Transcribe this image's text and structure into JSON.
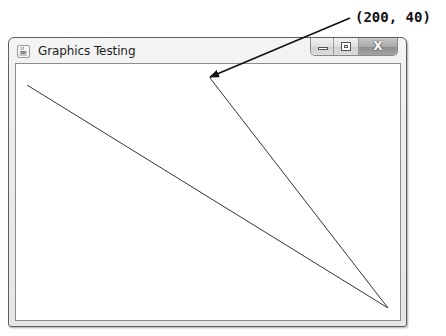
{
  "window": {
    "title": "Graphics Testing",
    "icon": "java-cup-icon",
    "controls": {
      "minimize": {
        "icon": "minimize-icon",
        "glyph": ""
      },
      "maximize": {
        "icon": "maximize-icon",
        "glyph": ""
      },
      "close": {
        "icon": "close-icon",
        "glyph": "X"
      }
    }
  },
  "canvas": {
    "background": "#ffffff",
    "line_color": "#333333",
    "lines": [
      {
        "x1": 27,
        "y1": 85,
        "x2": 388,
        "y2": 308
      },
      {
        "x1": 210,
        "y1": 78,
        "x2": 388,
        "y2": 308
      }
    ]
  },
  "annotation": {
    "label": "(200, 40)",
    "arrow": {
      "x1": 350,
      "y1": 18,
      "x2": 210,
      "y2": 77
    },
    "color": "#111111"
  }
}
